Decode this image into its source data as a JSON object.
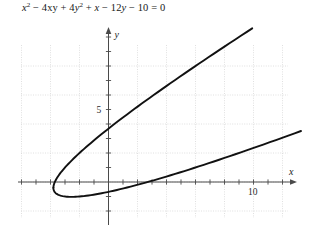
{
  "figure": {
    "equation_text": "x² − 4xy + 4y² + x − 12y − 10 = 0",
    "equation_parts": {
      "x": "x",
      "sup2a": "2",
      "minus_4xy": " − 4xy + 4",
      "y": "y",
      "sup2b": "2",
      "plus_x": " + ",
      "x2": "x",
      "minus_12y": " − 12",
      "y2": "y",
      "tail": " − 10 = 0"
    }
  },
  "chart_data": {
    "type": "line",
    "xlabel": "x",
    "ylabel": "y",
    "xlim": [
      -6,
      13.5
    ],
    "ylim": [
      -2.5,
      10.5
    ],
    "grid": true,
    "grid_step": 2,
    "tick_step": 1,
    "legend": "none",
    "x_tick_labels": [
      {
        "value": 10,
        "label": "10"
      }
    ],
    "y_tick_labels": [
      {
        "value": 5,
        "label": "5"
      }
    ],
    "axis_arrow_labels": {
      "x": "x",
      "y": "y"
    },
    "curve_description": "Rotated parabola, axis of symmetry along direction x = 2y; opens toward upper right",
    "series": [
      {
        "name": "upper-branch",
        "points": [
          [
            -2.2,
            0.0
          ],
          [
            -2.3,
            0.35
          ],
          [
            -2.25,
            0.7
          ],
          [
            -2.05,
            1.15
          ],
          [
            -1.7,
            1.6
          ],
          [
            -1.2,
            2.05
          ],
          [
            -0.6,
            2.5
          ],
          [
            0.1,
            2.95
          ],
          [
            0.9,
            3.45
          ],
          [
            1.8,
            3.95
          ],
          [
            2.8,
            4.5
          ],
          [
            3.9,
            5.05
          ],
          [
            5.1,
            5.65
          ],
          [
            6.4,
            6.3
          ],
          [
            7.8,
            6.95
          ],
          [
            9.3,
            7.65
          ],
          [
            10.9,
            8.4
          ],
          [
            11.5,
            8.7
          ]
        ]
      },
      {
        "name": "lower-branch",
        "points": [
          [
            -2.2,
            0.0
          ],
          [
            -1.95,
            -0.3
          ],
          [
            -1.5,
            -0.55
          ],
          [
            -0.9,
            -0.7
          ],
          [
            -0.1,
            -0.75
          ],
          [
            0.9,
            -0.7
          ],
          [
            2.0,
            -0.55
          ],
          [
            3.2,
            -0.35
          ],
          [
            4.5,
            -0.1
          ],
          [
            5.9,
            0.2
          ],
          [
            7.4,
            0.55
          ],
          [
            9.0,
            0.95
          ],
          [
            10.7,
            1.35
          ],
          [
            12.5,
            1.8
          ],
          [
            13.3,
            2.0
          ]
        ]
      }
    ]
  }
}
